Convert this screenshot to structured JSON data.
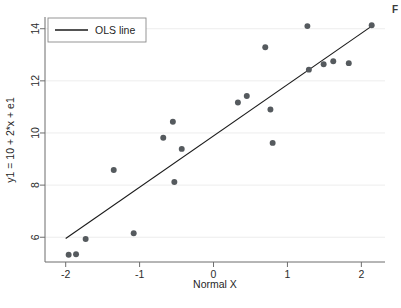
{
  "figure": {
    "background_color": "#ffffff",
    "edge_text_fragment": "F"
  },
  "chart_data": {
    "type": "scatter",
    "title": "",
    "subtitle": "",
    "xlabel": "Normal X",
    "ylabel": "y1 = 10 + 2*x + e1",
    "xlim": [
      -2.28,
      2.32
    ],
    "ylim": [
      5.05,
      14.45
    ],
    "xticks": [
      -2,
      -1,
      0,
      1,
      2
    ],
    "xtick_labels": [
      "-2",
      "-1",
      "0",
      "1",
      "2"
    ],
    "yticks": [
      6,
      8,
      10,
      12,
      14
    ],
    "ytick_labels": [
      "6",
      "8",
      "10",
      "12",
      "14"
    ],
    "grid": "horizontal-faint",
    "grid_color": "#ededed",
    "legend": {
      "position": "top-left-inside",
      "entries": [
        {
          "label": "OLS line",
          "marker": "line",
          "color": "#1a1a1a"
        }
      ]
    },
    "series": [
      {
        "name": "observations",
        "type": "scatter",
        "marker": "circle",
        "marker_color": "#555a5e",
        "marker_size": 4.6,
        "points": [
          {
            "x": -1.96,
            "y": 5.33
          },
          {
            "x": -1.86,
            "y": 5.35
          },
          {
            "x": -1.73,
            "y": 5.93
          },
          {
            "x": -1.35,
            "y": 8.58
          },
          {
            "x": -1.08,
            "y": 6.15
          },
          {
            "x": -0.68,
            "y": 9.82
          },
          {
            "x": -0.55,
            "y": 10.43
          },
          {
            "x": -0.53,
            "y": 8.12
          },
          {
            "x": -0.43,
            "y": 9.39
          },
          {
            "x": 0.33,
            "y": 11.17
          },
          {
            "x": 0.45,
            "y": 11.42
          },
          {
            "x": 0.7,
            "y": 13.29
          },
          {
            "x": 0.77,
            "y": 10.9
          },
          {
            "x": 0.8,
            "y": 9.62
          },
          {
            "x": 1.27,
            "y": 14.1
          },
          {
            "x": 1.29,
            "y": 12.43
          },
          {
            "x": 1.49,
            "y": 12.64
          },
          {
            "x": 1.62,
            "y": 12.75
          },
          {
            "x": 1.83,
            "y": 12.68
          },
          {
            "x": 2.14,
            "y": 14.13
          }
        ]
      },
      {
        "name": "OLS line",
        "type": "line",
        "color": "#1a1a1a",
        "line_width": 1.1,
        "endpoints": [
          {
            "x": -2.0,
            "y": 5.95
          },
          {
            "x": 2.15,
            "y": 14.12
          }
        ]
      }
    ]
  }
}
